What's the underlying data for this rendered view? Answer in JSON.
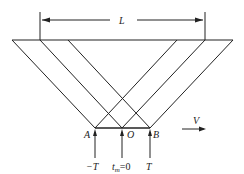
{
  "diagram": {
    "length_label": "L",
    "velocity_label": "V",
    "points": {
      "A": "A",
      "O": "O",
      "B": "B"
    },
    "time_labels": {
      "minus_T": "−T",
      "t_m": "t",
      "t_m_sub": "m",
      "t_m_eq": "=0",
      "T": "T"
    },
    "stroke_color": "#222222"
  }
}
